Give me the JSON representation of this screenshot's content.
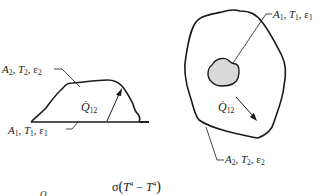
{
  "left_configuration": {
    "outer_label": {
      "area": "A",
      "temp": "T",
      "emiss": "ε",
      "index": "2"
    },
    "inner_label": {
      "area": "A",
      "temp": "T",
      "emiss": "ε",
      "index": "1"
    },
    "heat_flow": {
      "symbol": "Q",
      "subscript": "12"
    }
  },
  "right_configuration": {
    "inner_label": {
      "area": "A",
      "temp": "T",
      "emiss": "ε",
      "index": "1"
    },
    "outer_label": {
      "area": "A",
      "temp": "T",
      "emiss": "ε",
      "index": "2"
    },
    "heat_flow": {
      "symbol": "Q",
      "subscript": "12"
    },
    "inner_body_fill": "#d9d9d9"
  },
  "equation": {
    "lhs_symbol": "Q",
    "numerator_sigma": "σ",
    "t1": "T",
    "t1_sub": "1",
    "t1_sup": "4",
    "minus": "−",
    "t2": "T",
    "t2_sub": "2",
    "t2_sup": "4"
  },
  "colors": {
    "line": "#1a1a1a",
    "fill_inner": "#d9d9d9"
  }
}
